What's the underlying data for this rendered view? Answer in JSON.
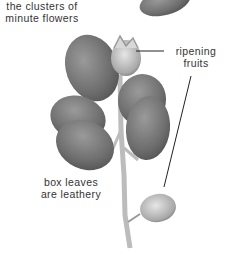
{
  "labels": {
    "flowers": [
      "the clusters of",
      "minute flowers"
    ],
    "fruits": [
      "ripening",
      "fruits"
    ],
    "leaves": [
      "box leaves",
      "are leathery"
    ]
  },
  "colors": {
    "leaf": "#7a7a7a",
    "leaf_dark": "#5e5e5e",
    "stem": "#b8b8b8",
    "text": "#333333",
    "pointer": "#222222"
  }
}
